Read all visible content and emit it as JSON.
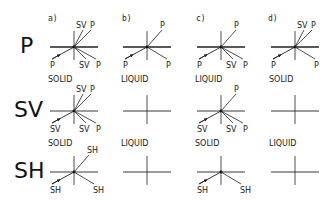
{
  "figure": {
    "rows": [
      {
        "label": "P"
      },
      {
        "label": "SV"
      },
      {
        "label": "SH"
      }
    ],
    "columns": [
      {
        "label": "a)"
      },
      {
        "label": "b)"
      },
      {
        "label": "c)"
      },
      {
        "label": "d)"
      }
    ],
    "cells": [
      [
        {
          "phase": "SOLID",
          "incident": "P",
          "rays": [
            {
              "kind": "up",
              "labels": [
                "SV",
                "P"
              ]
            },
            {
              "kind": "down",
              "labels": [
                "SV",
                "P"
              ]
            }
          ]
        },
        {
          "phase": "LIQUID",
          "incident": "P",
          "rays": [
            {
              "kind": "up",
              "labels": [
                "P"
              ]
            },
            {
              "kind": "down",
              "labels": [
                "P"
              ]
            }
          ]
        },
        {
          "phase": "LIQUID",
          "incident": "P",
          "rays": [
            {
              "kind": "up",
              "labels": [
                "P"
              ]
            },
            {
              "kind": "down",
              "labels": [
                "SV",
                "P"
              ]
            }
          ]
        },
        {
          "phase": "SOLID",
          "incident": "P",
          "rays": [
            {
              "kind": "up",
              "labels": [
                "SV",
                "P"
              ]
            },
            {
              "kind": "down",
              "labels": [
                "P"
              ]
            }
          ]
        }
      ],
      [
        {
          "phase": "SOLID",
          "incident": "SV",
          "rays": [
            {
              "kind": "up",
              "labels": [
                "SV",
                "P"
              ]
            },
            {
              "kind": "down",
              "labels": [
                "SV",
                "P"
              ]
            }
          ]
        },
        {
          "phase": "LIQUID",
          "incident": null,
          "rays": []
        },
        {
          "phase": "SOLID",
          "incident": "SV",
          "rays": [
            {
              "kind": "up",
              "labels": [
                "P"
              ]
            },
            {
              "kind": "down",
              "labels": [
                "SV",
                "P"
              ]
            }
          ]
        },
        {
          "phase": "LIQUID",
          "incident": null,
          "rays": []
        }
      ],
      [
        {
          "phase": "",
          "incident": "SH",
          "rays": [
            {
              "kind": "up",
              "labels": [
                "SH"
              ]
            },
            {
              "kind": "down",
              "labels": [
                "SH"
              ]
            }
          ]
        },
        {
          "phase": "",
          "incident": null,
          "rays": []
        },
        {
          "phase": "",
          "incident": "SH",
          "rays": [
            {
              "kind": "down",
              "labels": [
                "SH"
              ]
            }
          ]
        },
        {
          "phase": "",
          "incident": null,
          "rays": []
        }
      ]
    ]
  }
}
